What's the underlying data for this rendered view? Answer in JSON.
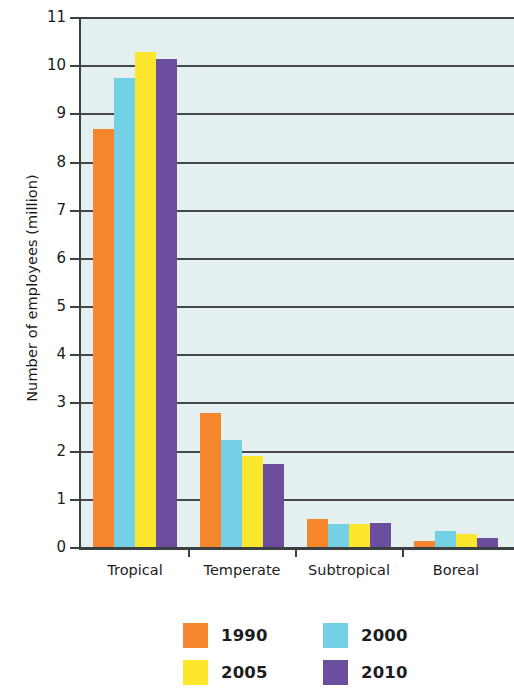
{
  "chart_data": {
    "type": "bar",
    "title": "",
    "xlabel": "",
    "ylabel": "Number of employees (million)",
    "categories": [
      "Tropical",
      "Temperate",
      "Subtropical",
      "Boreal"
    ],
    "series": [
      {
        "name": "1990",
        "color": "#F5862E",
        "values": [
          8.7,
          2.8,
          0.6,
          0.15
        ]
      },
      {
        "name": "2000",
        "color": "#74D0E5",
        "values": [
          9.75,
          2.25,
          0.5,
          0.35
        ]
      },
      {
        "name": "2005",
        "color": "#FCE72E",
        "values": [
          10.3,
          1.9,
          0.5,
          0.3
        ]
      },
      {
        "name": "2010",
        "color": "#6B4E9E",
        "values": [
          10.15,
          1.75,
          0.52,
          0.2
        ]
      }
    ],
    "ylim": [
      0,
      11
    ],
    "yticks": [
      "0",
      "1",
      "2",
      "3",
      "4",
      "5",
      "6",
      "7",
      "8",
      "9",
      "10",
      "11"
    ],
    "grid": true,
    "legend_position": "bottom",
    "plot_background": "#E4EFF0",
    "axis_color": "#3B4143"
  }
}
